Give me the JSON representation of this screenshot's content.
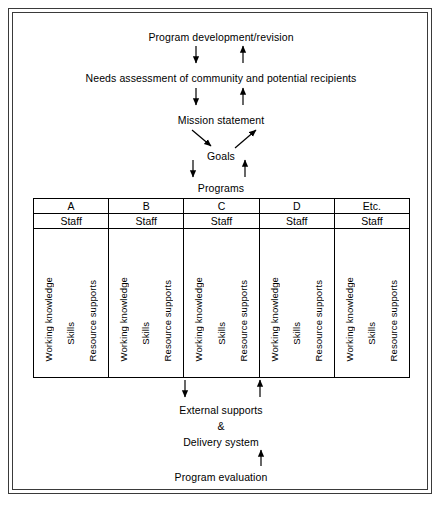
{
  "diagram": {
    "title_flow": [
      {
        "id": "program-development",
        "text": "Program development/revision"
      },
      {
        "id": "needs-assessment",
        "text": "Needs assessment of community and potential recipients"
      },
      {
        "id": "mission-statement",
        "text": "Mission statement"
      },
      {
        "id": "goals",
        "text": "Goals"
      },
      {
        "id": "programs",
        "text": "Programs"
      }
    ],
    "bottom_flow": [
      {
        "id": "external-supports",
        "text": "External supports"
      },
      {
        "id": "ampersand",
        "text": "&"
      },
      {
        "id": "delivery-system",
        "text": "Delivery system"
      },
      {
        "id": "program-evaluation",
        "text": "Program evaluation"
      }
    ],
    "table": {
      "staff_label": "Staff",
      "row_labels": [
        "Working knowledge",
        "Skills",
        "Resource supports"
      ],
      "columns": [
        {
          "header": "A",
          "staff": "Staff",
          "items": [
            "Working knowledge",
            "Skills",
            "Resource supports"
          ]
        },
        {
          "header": "B",
          "staff": "Staff",
          "items": [
            "Working knowledge",
            "Skills",
            "Resource supports"
          ]
        },
        {
          "header": "C",
          "staff": "Staff",
          "items": [
            "Working knowledge",
            "Skills",
            "Resource supports"
          ]
        },
        {
          "header": "D",
          "staff": "Staff",
          "items": [
            "Working knowledge",
            "Skills",
            "Resource supports"
          ]
        },
        {
          "header": "Etc.",
          "staff": "Staff",
          "items": [
            "Working knowledge",
            "Skills",
            "Resource supports"
          ]
        }
      ]
    },
    "colors": {
      "ink": "#000000",
      "frame": "#3a3a3a",
      "background": "#ffffff"
    }
  }
}
